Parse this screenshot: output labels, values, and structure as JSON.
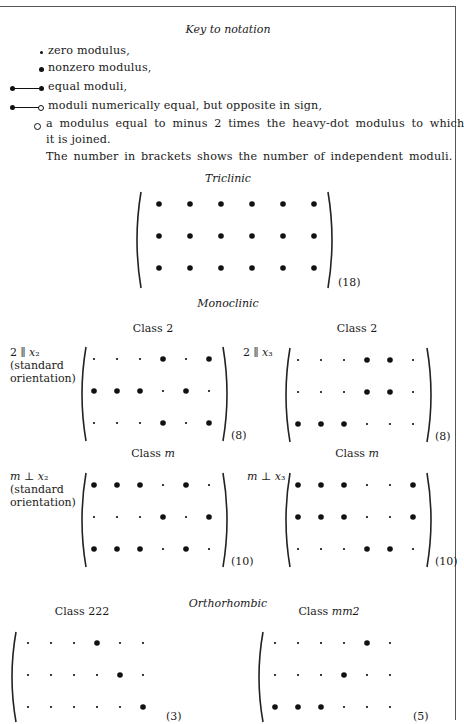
{
  "key": {
    "title": "Key to notation",
    "items": [
      {
        "symbol": "small-dot",
        "text": "zero modulus,"
      },
      {
        "symbol": "heavy-dot",
        "text": "nonzero modulus,"
      },
      {
        "symbol": "heavy-dot-line-heavy-dot",
        "text": "equal moduli,"
      },
      {
        "symbol": "heavy-dot-line-open-dot",
        "text": "moduli numerically equal, but opposite in sign,"
      },
      {
        "symbol": "open-circle",
        "text": "a modulus equal to minus 2 times the heavy-dot  modulus to which"
      }
    ],
    "continuation": "it is joined.",
    "note": "The number in brackets shows the number of independent moduli."
  },
  "sections": {
    "triclinic": "Triclinic",
    "monoclinic": "Monoclinic",
    "orthorhombic": "Orthorhombic"
  },
  "matrices": {
    "triclinic": {
      "title": "",
      "side_label": [],
      "count": "(18)",
      "rows": [
        "BBBBBB",
        "BBBBBB",
        "BBBBBB"
      ]
    },
    "mono_class2_x2": {
      "title": "Class 2",
      "side_label": [
        "2 ∥ x₂",
        "(standard",
        "orientation)"
      ],
      "count": "(8)",
      "rows": [
        "sssBsB",
        "BBBsBs",
        "sssBsB"
      ]
    },
    "mono_class2_x3": {
      "title": "Class 2",
      "side_label": [
        "2 ∥ x₃"
      ],
      "count": "(8)",
      "rows": [
        "sssBBs",
        "sssBBs",
        "BBBsss"
      ]
    },
    "mono_classm_x2": {
      "title": "Class m",
      "side_label": [
        "m ⊥ x₂",
        "(standard",
        "orientation)"
      ],
      "count": "(10)",
      "rows": [
        "BBBsBs",
        "sssBsB",
        "BBBsBs"
      ]
    },
    "mono_classm_x3": {
      "title": "Class m",
      "side_label": [
        "m ⊥ x₃"
      ],
      "count": "(10)",
      "rows": [
        "BBBssB",
        "BBBssB",
        "sssBBs"
      ]
    },
    "ortho_class222": {
      "title": "Class 222",
      "side_label": [],
      "count": "(3)",
      "rows": [
        "sssBss",
        "ssssBs",
        "sssssB"
      ]
    },
    "ortho_classmm2": {
      "title": "Class mm2",
      "side_label": [],
      "count": "(5)",
      "rows": [
        "ssssBs",
        "sssBss",
        "BBBsss"
      ]
    }
  }
}
